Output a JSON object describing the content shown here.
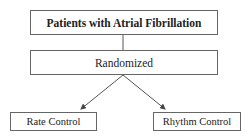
{
  "diagram": {
    "type": "flowchart",
    "nodes": {
      "root": "Patients with Atrial Fibrillation",
      "step": "Randomized",
      "branch_left": "Rate Control",
      "branch_right": "Rhythm Control"
    },
    "edges": [
      {
        "from": "root",
        "to": "step",
        "style": "line"
      },
      {
        "from": "step",
        "to": "branch_left",
        "style": "arrow"
      },
      {
        "from": "step",
        "to": "branch_right",
        "style": "arrow"
      }
    ],
    "colors": {
      "border": "#666666",
      "text": "#222222",
      "background": "#ffffff"
    }
  }
}
